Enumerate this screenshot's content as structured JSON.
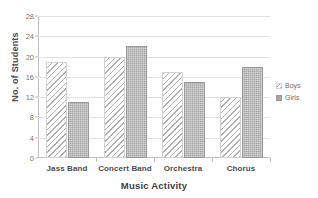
{
  "chart_data": {
    "type": "bar",
    "title": "",
    "title_clipped": true,
    "categories": [
      "Jass Band",
      "Concert Band",
      "Orchestra",
      "Chorus"
    ],
    "series": [
      {
        "name": "Boys",
        "values": [
          19,
          20,
          17,
          12
        ],
        "pattern": "diagonal-hatch",
        "color": "#f2f2f2"
      },
      {
        "name": "Girls",
        "values": [
          11,
          22,
          15,
          18
        ],
        "pattern": "solid-gray",
        "color": "#a6a6a6"
      }
    ],
    "xlabel": "Music Activity",
    "ylabel": "No. of Students",
    "ylim": [
      0,
      28
    ],
    "ytick_step": 4,
    "yticks": [
      0,
      4,
      8,
      12,
      16,
      20,
      24,
      28
    ],
    "grid": "horizontal",
    "legend_position": "right"
  },
  "axes": {
    "y_title": "No. of Students",
    "x_title": "Music Activity",
    "y_tick_labels": [
      "0",
      "4",
      "8",
      "12",
      "16",
      "20",
      "24",
      "28"
    ],
    "x_tick_labels": [
      "Jass Band",
      "Concert Band",
      "Orchestra",
      "Chorus"
    ]
  },
  "legend": {
    "items": [
      {
        "label": "Boys"
      },
      {
        "label": "Girls"
      }
    ]
  },
  "colors": {
    "axis": "#bfbfbf",
    "gridline": "#e2e2e2",
    "text": "#4c4c4c",
    "boys_fill": "#f2f2f2",
    "girls_fill": "#a6a6a6",
    "background": "#ffffff"
  }
}
